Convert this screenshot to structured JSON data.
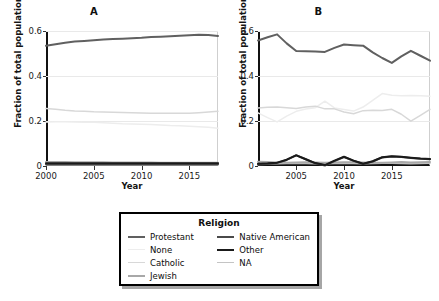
{
  "figure": {
    "panels": [
      {
        "key": "A",
        "title": "A",
        "xlabel": "Year",
        "ylabel": "Fraction of total population",
        "xticks": [
          "2000",
          "2005",
          "2010",
          "2015"
        ],
        "yticks": [
          "0",
          "0.2",
          "0.4",
          "0.6"
        ]
      },
      {
        "key": "B",
        "title": "B",
        "xlabel": "Year",
        "ylabel": "Fraction of total population",
        "xticks": [
          "2005",
          "2010",
          "2015"
        ],
        "yticks": [
          "0",
          "0.2",
          "0.4",
          "0.6"
        ]
      }
    ]
  },
  "legend": {
    "title": "Religion",
    "left_column": [
      {
        "label": "Protestant",
        "color": "#606060"
      },
      {
        "label": "None",
        "color": "#ededed"
      },
      {
        "label": "Catholic",
        "color": "#d8d8d8"
      },
      {
        "label": "Jewish",
        "color": "#a8a8a8"
      }
    ],
    "right_column": [
      {
        "label": "Native American",
        "color": "#4a4a4a"
      },
      {
        "label": "Other",
        "color": "#1a1a1a"
      },
      {
        "label": "NA",
        "color": "#c4c4c4"
      }
    ]
  },
  "chart_data": [
    {
      "type": "line",
      "panel": "A",
      "title": "A",
      "xlabel": "Year",
      "ylabel": "Fraction of total population",
      "xlim": [
        2000,
        2018
      ],
      "ylim": [
        0,
        0.6
      ],
      "xticks": [
        2000,
        2005,
        2010,
        2015
      ],
      "yticks": [
        0,
        0.2,
        0.4,
        0.6
      ],
      "grid": true,
      "legend_position": "below-figure",
      "x": [
        2000,
        2001,
        2002,
        2003,
        2004,
        2005,
        2006,
        2007,
        2008,
        2009,
        2010,
        2011,
        2012,
        2013,
        2014,
        2015,
        2016,
        2017,
        2018
      ],
      "series": [
        {
          "name": "Protestant",
          "color": "#606060",
          "values": [
            0.534,
            0.541,
            0.548,
            0.553,
            0.556,
            0.559,
            0.562,
            0.564,
            0.566,
            0.568,
            0.57,
            0.573,
            0.575,
            0.577,
            0.579,
            0.581,
            0.583,
            0.582,
            0.578
          ]
        },
        {
          "name": "None",
          "color": "#ededed",
          "values": [
            0.196,
            0.197,
            0.197,
            0.196,
            0.195,
            0.194,
            0.192,
            0.19,
            0.188,
            0.187,
            0.186,
            0.184,
            0.182,
            0.18,
            0.179,
            0.177,
            0.175,
            0.172,
            0.168
          ]
        },
        {
          "name": "Catholic",
          "color": "#d8d8d8",
          "values": [
            0.256,
            0.252,
            0.248,
            0.245,
            0.243,
            0.241,
            0.24,
            0.239,
            0.238,
            0.237,
            0.236,
            0.235,
            0.235,
            0.234,
            0.234,
            0.235,
            0.237,
            0.24,
            0.243
          ]
        },
        {
          "name": "Jewish",
          "color": "#a8a8a8",
          "values": [
            0.018,
            0.018,
            0.018,
            0.017,
            0.017,
            0.017,
            0.017,
            0.016,
            0.016,
            0.016,
            0.016,
            0.016,
            0.015,
            0.015,
            0.015,
            0.015,
            0.015,
            0.014,
            0.014
          ]
        },
        {
          "name": "Native American",
          "color": "#4a4a4a",
          "values": [
            0.008,
            0.008,
            0.008,
            0.008,
            0.008,
            0.008,
            0.008,
            0.008,
            0.008,
            0.008,
            0.008,
            0.008,
            0.008,
            0.008,
            0.008,
            0.008,
            0.008,
            0.008,
            0.008
          ]
        },
        {
          "name": "Other",
          "color": "#1a1a1a",
          "values": [
            0.012,
            0.012,
            0.012,
            0.012,
            0.012,
            0.012,
            0.012,
            0.012,
            0.012,
            0.012,
            0.012,
            0.012,
            0.012,
            0.012,
            0.012,
            0.012,
            0.012,
            0.012,
            0.012
          ]
        },
        {
          "name": "NA",
          "color": "#c4c4c4",
          "values": [
            0.005,
            0.005,
            0.005,
            0.005,
            0.005,
            0.005,
            0.005,
            0.005,
            0.005,
            0.005,
            0.005,
            0.005,
            0.005,
            0.005,
            0.005,
            0.005,
            0.005,
            0.005,
            0.005
          ]
        }
      ]
    },
    {
      "type": "line",
      "panel": "B",
      "title": "B",
      "xlabel": "Year",
      "ylabel": "Fraction of total population",
      "xlim": [
        2001,
        2019
      ],
      "ylim": [
        0,
        0.6
      ],
      "xticks": [
        2005,
        2010,
        2015
      ],
      "yticks": [
        0,
        0.2,
        0.4,
        0.6
      ],
      "grid": true,
      "legend_position": "below-figure",
      "x": [
        2001,
        2002,
        2003,
        2004,
        2005,
        2006,
        2007,
        2008,
        2009,
        2010,
        2011,
        2012,
        2013,
        2014,
        2015,
        2016,
        2017,
        2018,
        2019
      ],
      "series": [
        {
          "name": "Protestant",
          "color": "#606060",
          "values": [
            0.558,
            0.572,
            0.585,
            0.545,
            0.511,
            0.51,
            0.509,
            0.507,
            0.525,
            0.54,
            0.537,
            0.535,
            0.505,
            0.48,
            0.458,
            0.487,
            0.512,
            0.49,
            0.468
          ]
        },
        {
          "name": "None",
          "color": "#ededed",
          "values": [
            0.236,
            0.215,
            0.196,
            0.222,
            0.243,
            0.253,
            0.259,
            0.288,
            0.258,
            0.251,
            0.244,
            0.262,
            0.292,
            0.322,
            0.314,
            0.312,
            0.313,
            0.312,
            0.31
          ]
        },
        {
          "name": "Catholic",
          "color": "#d8d8d8",
          "values": [
            0.258,
            0.261,
            0.262,
            0.259,
            0.256,
            0.262,
            0.266,
            0.254,
            0.254,
            0.24,
            0.232,
            0.246,
            0.248,
            0.247,
            0.252,
            0.23,
            0.199,
            0.225,
            0.252
          ]
        },
        {
          "name": "Jewish",
          "color": "#a8a8a8",
          "values": [
            0.019,
            0.018,
            0.016,
            0.015,
            0.016,
            0.017,
            0.016,
            0.015,
            0.016,
            0.017,
            0.017,
            0.016,
            0.015,
            0.014,
            0.016,
            0.018,
            0.016,
            0.017,
            0.018
          ]
        },
        {
          "name": "Native American",
          "color": "#4a4a4a",
          "values": [
            0.006,
            0.009,
            0.014,
            0.027,
            0.048,
            0.03,
            0.012,
            0.002,
            0.022,
            0.04,
            0.023,
            0.009,
            0.02,
            0.038,
            0.042,
            0.04,
            0.036,
            0.032,
            0.03
          ]
        },
        {
          "name": "Other",
          "color": "#1a1a1a",
          "values": [
            0.01,
            0.012,
            0.015,
            0.028,
            0.047,
            0.03,
            0.013,
            0.004,
            0.024,
            0.041,
            0.024,
            0.01,
            0.021,
            0.039,
            0.043,
            0.041,
            0.037,
            0.033,
            0.031
          ]
        },
        {
          "name": "NA",
          "color": "#c4c4c4",
          "values": [
            0.011,
            0.01,
            0.01,
            0.011,
            0.012,
            0.011,
            0.01,
            0.01,
            0.011,
            0.012,
            0.011,
            0.01,
            0.011,
            0.012,
            0.012,
            0.011,
            0.01,
            0.011,
            0.012
          ]
        }
      ]
    }
  ]
}
